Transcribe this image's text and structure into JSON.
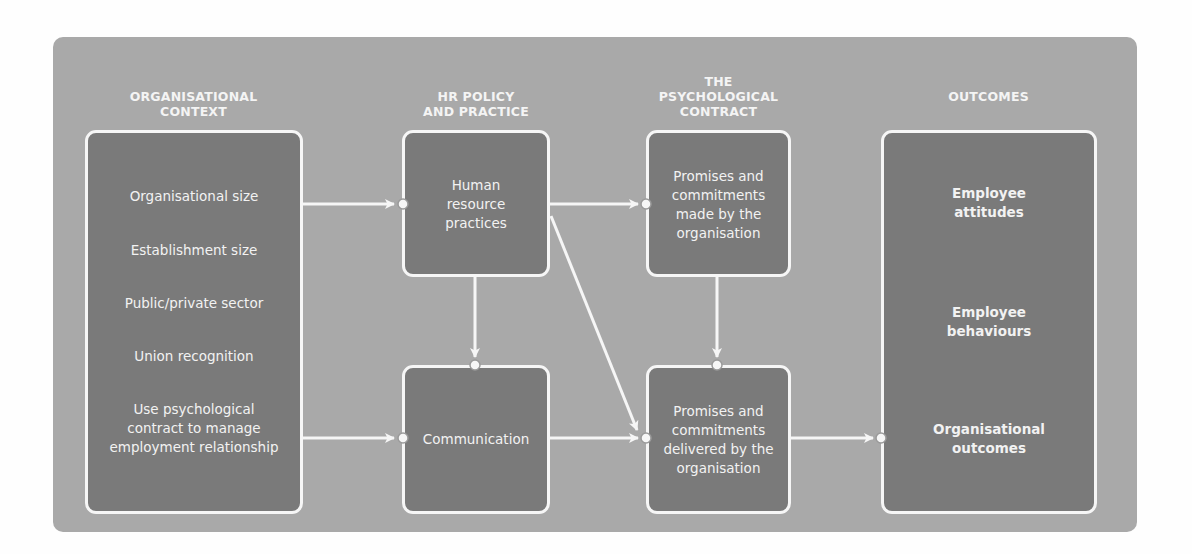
{
  "diagram": {
    "columns": [
      {
        "id": "organisational-context",
        "title_lines": [
          "ORGANISATIONAL",
          "CONTEXT"
        ]
      },
      {
        "id": "hr-policy",
        "title_lines": [
          "HR POLICY",
          "AND PRACTICE"
        ]
      },
      {
        "id": "psychological-contract",
        "title_lines": [
          "THE",
          "PSYCHOLOGICAL",
          "CONTRACT"
        ]
      },
      {
        "id": "outcomes",
        "title_lines": [
          "OUTCOMES"
        ]
      }
    ],
    "boxes": {
      "context": {
        "items": [
          {
            "lines": [
              "Organisational size"
            ]
          },
          {
            "lines": [
              "Establishment size"
            ]
          },
          {
            "lines": [
              "Public/private sector"
            ]
          },
          {
            "lines": [
              "Union recognition"
            ]
          },
          {
            "lines": [
              "Use psychological",
              "contract to manage",
              "employment relationship"
            ]
          }
        ]
      },
      "hr_practices": {
        "lines": [
          "Human",
          "resource",
          "practices"
        ]
      },
      "communication": {
        "lines": [
          "Communication"
        ]
      },
      "promises_made": {
        "lines": [
          "Promises and",
          "commitments",
          "made by the",
          "organisation"
        ]
      },
      "promises_delivered": {
        "lines": [
          "Promises and",
          "commitments",
          "delivered by the",
          "organisation"
        ]
      },
      "outcomes": {
        "items": [
          {
            "lines": [
              "Employee",
              "attitudes"
            ]
          },
          {
            "lines": [
              "Employee",
              "behaviours"
            ]
          },
          {
            "lines": [
              "Organisational",
              "outcomes"
            ]
          }
        ]
      }
    },
    "edges": [
      {
        "from": "context",
        "to": "hr_practices"
      },
      {
        "from": "context",
        "to": "communication"
      },
      {
        "from": "hr_practices",
        "to": "promises_made"
      },
      {
        "from": "hr_practices",
        "to": "communication"
      },
      {
        "from": "hr_practices",
        "to": "promises_delivered"
      },
      {
        "from": "promises_made",
        "to": "promises_delivered"
      },
      {
        "from": "communication",
        "to": "promises_delivered"
      },
      {
        "from": "promises_delivered",
        "to": "outcomes"
      }
    ],
    "colors": {
      "panel": "#a9a9a9",
      "box_fill": "#7a7a7a",
      "stroke": "#f6f6f6",
      "text": "#f2f2f2"
    }
  }
}
